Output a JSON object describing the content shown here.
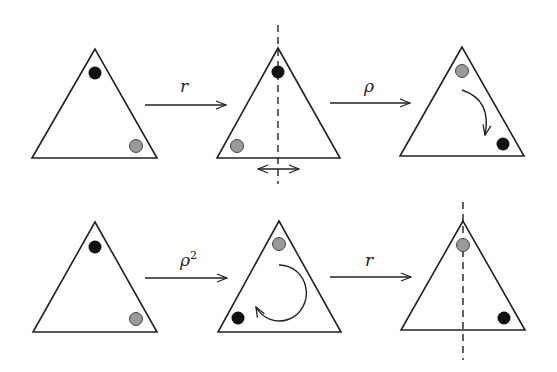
{
  "diagram": {
    "colors": {
      "line": "#222222",
      "black_dot": "#111111",
      "gray_dot": "#9a9a9a",
      "background": "#ffffff"
    },
    "rows": [
      {
        "states": [
          {
            "dots": [
              "black at top vertex",
              "gray at bottom-right vertex"
            ]
          },
          {
            "dots": [
              "black at top vertex",
              "gray at bottom-left vertex"
            ],
            "annotation": "vertical dashed reflection axis with double-headed horizontal arrow"
          },
          {
            "dots": [
              "gray at top vertex",
              "black at bottom-right vertex"
            ],
            "annotation": "clockwise curved arrow"
          }
        ],
        "transitions": [
          {
            "label": "r",
            "exponent": ""
          },
          {
            "label": "ρ",
            "exponent": ""
          }
        ]
      },
      {
        "states": [
          {
            "dots": [
              "black at top vertex",
              "gray at bottom-right vertex"
            ]
          },
          {
            "dots": [
              "gray at top vertex",
              "black at bottom-left vertex"
            ],
            "annotation": "large clockwise curved arrow"
          },
          {
            "dots": [
              "gray at top vertex",
              "black at bottom-right vertex"
            ],
            "annotation": "vertical dashed reflection axis"
          }
        ],
        "transitions": [
          {
            "label": "ρ",
            "exponent": "2"
          },
          {
            "label": "r",
            "exponent": ""
          }
        ]
      }
    ]
  }
}
